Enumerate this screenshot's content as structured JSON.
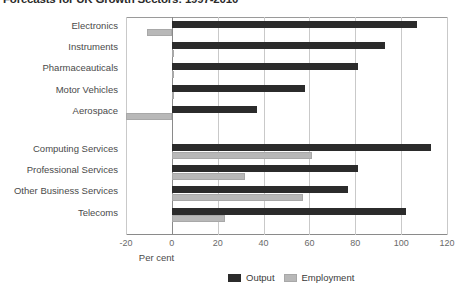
{
  "chart_data": {
    "type": "bar",
    "orientation": "horizontal",
    "title": "Forecasts for UK Growth Sectors: 1997-2010",
    "xlabel": "Per cent",
    "ylabel": "",
    "xlim": [
      -20,
      120
    ],
    "xticks": [
      -20,
      0,
      20,
      40,
      60,
      80,
      100,
      120
    ],
    "xticklabels": [
      "-20",
      "0",
      "20",
      "40",
      "60",
      "80",
      "100",
      "120"
    ],
    "grid": true,
    "legend_position": "bottom-right",
    "categories": [
      "Electronics",
      "Instruments",
      "Pharmaceauticals",
      "Motor Vehicles",
      "Aerospace",
      "Computing Services",
      "Professional Services",
      "Other Business Services",
      "Telecoms"
    ],
    "series": [
      {
        "name": "Output",
        "color": "#2b2b2b",
        "values": [
          107,
          93,
          81,
          58,
          37,
          113,
          81,
          77,
          102
        ]
      },
      {
        "name": "Employment",
        "color": "#b8b8b8",
        "values": [
          -11,
          1,
          0,
          1,
          -20,
          61,
          32,
          57,
          23
        ]
      }
    ]
  },
  "legend": {
    "items": [
      {
        "label": "Output",
        "swatch": "output"
      },
      {
        "label": "Employment",
        "swatch": "employment"
      }
    ]
  }
}
